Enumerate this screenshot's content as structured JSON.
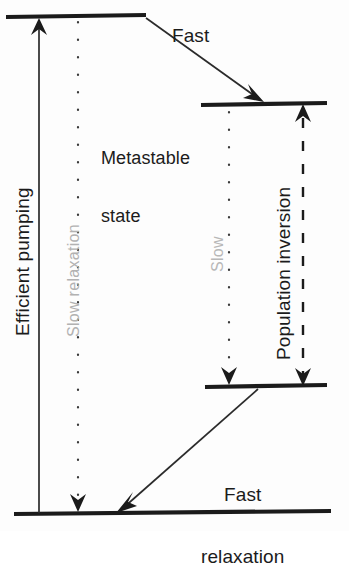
{
  "diagram": {
    "background_color": "#fdfdfd",
    "ink_color": "#1b1b1b",
    "faint_color": "#b2b2b2"
  },
  "levels": [
    {
      "id": "pump-level",
      "name": "upper-pump-level",
      "label": "",
      "x1": 6,
      "x2": 146,
      "y": 17
    },
    {
      "id": "metastable-level",
      "name": "metastable-level",
      "label": "Metastable\nstate",
      "x1": 201,
      "x2": 327,
      "y": 104
    },
    {
      "id": "lower-laser-level",
      "name": "lower-laser-level",
      "label": "",
      "x1": 205,
      "x2": 327,
      "y": 386
    },
    {
      "id": "ground-level",
      "name": "ground-level",
      "label": "",
      "x1": 14,
      "x2": 331,
      "y": 513
    }
  ],
  "labels": {
    "fast": "Fast",
    "metastable_line1": "Metastable",
    "metastable_line2": "state",
    "fast_relaxation_line1": "Fast",
    "fast_relaxation_line2": "relaxation",
    "efficient_pumping": "Efficient pumping",
    "slow_relaxation": "Slow relaxation",
    "slow": "Slow",
    "population_inversion": "Population inversion"
  },
  "arrows": [
    {
      "name": "efficient-pumping-arrow",
      "label": "Efficient pumping",
      "style": "solid",
      "heads": "up",
      "from": [
        39,
        513
      ],
      "to": [
        39,
        19
      ]
    },
    {
      "name": "slow-relaxation-arrow",
      "label": "Slow relaxation",
      "style": "dotted",
      "heads": "down",
      "from": [
        78,
        20
      ],
      "to": [
        78,
        511
      ]
    },
    {
      "name": "fast-transition-arrow",
      "label": "Fast",
      "style": "solid",
      "heads": "down-right",
      "from": [
        146,
        19
      ],
      "to": [
        262,
        101
      ]
    },
    {
      "name": "slow-transition-arrow",
      "label": "Slow",
      "style": "dotted",
      "heads": "down",
      "from": [
        229,
        108
      ],
      "to": [
        229,
        384
      ]
    },
    {
      "name": "population-inversion-arrow",
      "label": "Population inversion",
      "style": "dashed",
      "heads": "both",
      "from": [
        303,
        384
      ],
      "to": [
        303,
        107
      ]
    },
    {
      "name": "fast-relaxation-arrow",
      "label": "Fast relaxation",
      "style": "solid",
      "heads": "down-left",
      "from": [
        258,
        389
      ],
      "to": [
        119,
        511
      ]
    }
  ]
}
